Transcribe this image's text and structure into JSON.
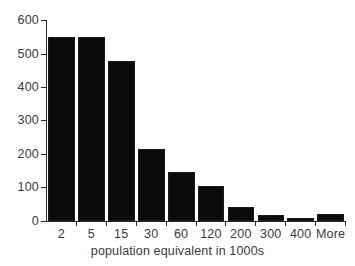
{
  "chart_data": {
    "type": "bar",
    "title": "",
    "subtitle": "",
    "xlabel": "population equivalent in 1000s",
    "ylabel": "",
    "categories": [
      "2",
      "5",
      "15",
      "30",
      "60",
      "120",
      "200",
      "300",
      "400",
      "More"
    ],
    "values": [
      552,
      552,
      478,
      216,
      147,
      105,
      41,
      18,
      10,
      20
    ],
    "series": [
      {
        "name": "frequency",
        "values": [
          552,
          552,
          478,
          216,
          147,
          105,
          41,
          18,
          10,
          20
        ]
      }
    ],
    "ylim": [
      0,
      600
    ],
    "yticks": [
      0,
      100,
      200,
      300,
      400,
      500,
      600
    ],
    "ytick_labels": [
      "0",
      "100",
      "200",
      "300",
      "400",
      "500",
      "600"
    ],
    "xtick_labels": [
      "2",
      "5",
      "15",
      "30",
      "60",
      "120",
      "200",
      "300",
      "400",
      "More"
    ],
    "grid": false,
    "legend": false,
    "legend_position": "none",
    "bar_color": "#0b0b0b",
    "bar_edge_color": "#1a1a1a",
    "axis_color": "#2a2a2a",
    "text_color": "#3a3a3a",
    "background_color": "#ffffff"
  }
}
